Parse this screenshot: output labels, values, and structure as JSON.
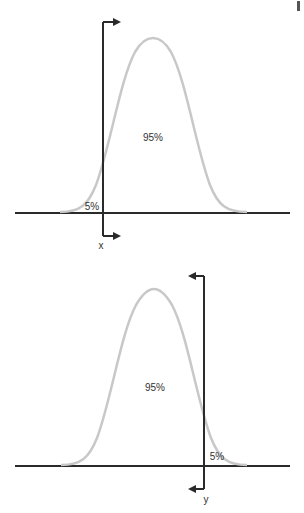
{
  "colors": {
    "curve": "#c8c8c8",
    "axis": "#2a2a2a",
    "text": "#333333"
  },
  "diagrams": [
    {
      "id": "left-tail",
      "center_label": "95%",
      "tail_label": "5%",
      "cutoff_label": "x",
      "tail_side": "left",
      "arrow_direction": "right"
    },
    {
      "id": "right-tail",
      "center_label": "95%",
      "tail_label": "5%",
      "cutoff_label": "y",
      "tail_side": "right",
      "arrow_direction": "left"
    }
  ]
}
